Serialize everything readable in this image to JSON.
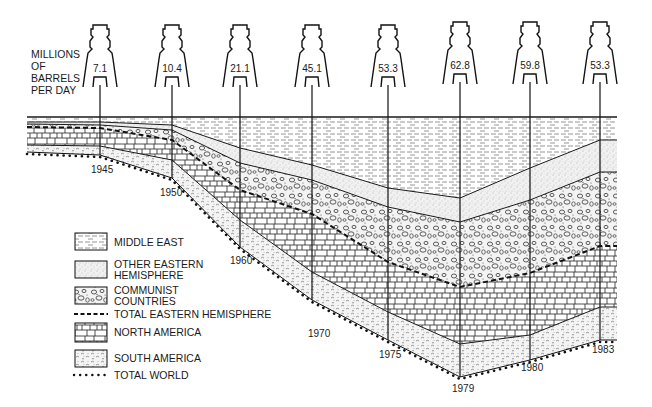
{
  "chart": {
    "unit_label_lines": [
      "MILLIONS",
      "OF",
      "BARRELS",
      "PER DAY"
    ]
  },
  "legend": {
    "items": [
      {
        "key": "middle_east",
        "lines": [
          "MIDDLE EAST"
        ],
        "style": "dashes"
      },
      {
        "key": "other_eastern_hemisphere",
        "lines": [
          "OTHER EASTERN",
          "HEMISPHERE"
        ],
        "style": "stipple"
      },
      {
        "key": "communist_countries",
        "lines": [
          "COMMUNIST",
          "COUNTRIES"
        ],
        "style": "pebbles"
      },
      {
        "key": "total_eastern_hemisphere",
        "lines": [
          "TOTAL EASTERN HEMISPHERE"
        ],
        "style": "dashed-line"
      },
      {
        "key": "north_america",
        "lines": [
          "NORTH AMERICA"
        ],
        "style": "bricks"
      },
      {
        "key": "south_america",
        "lines": [
          "SOUTH AMERICA"
        ],
        "style": "wavy"
      },
      {
        "key": "total_world",
        "lines": [
          "TOTAL WORLD"
        ],
        "style": "dotted-line"
      }
    ]
  },
  "towers": [
    {
      "year": "1945",
      "value": "7.1"
    },
    {
      "year": "1950",
      "value": "10.4"
    },
    {
      "year": "1960",
      "value": "21.1"
    },
    {
      "year": "1970",
      "value": "45.1"
    },
    {
      "year": "1975",
      "value": "53.3"
    },
    {
      "year": "1979",
      "value": "62.8"
    },
    {
      "year": "1980",
      "value": "59.8"
    },
    {
      "year": "1983",
      "value": "53.3"
    }
  ],
  "chart_data": {
    "type": "area",
    "ylabel": "MILLIONS OF BARRELS PER DAY",
    "xlabel": "",
    "orientation": "inverted stacked area (layers hang downward from a top baseline)",
    "categories": [
      "1945",
      "1950",
      "1960",
      "1970",
      "1975",
      "1979",
      "1980",
      "1983"
    ],
    "totals": [
      7.1,
      10.4,
      21.1,
      45.1,
      53.3,
      62.8,
      59.8,
      53.3
    ],
    "series": [
      {
        "name": "MIDDLE EAST",
        "values": [
          0.5,
          1.8,
          5.3,
          13.9,
          19.6,
          21.1,
          18.7,
          12.1
        ]
      },
      {
        "name": "OTHER EASTERN HEMISPHERE",
        "values": [
          0.2,
          0.5,
          1.5,
          4.5,
          5.1,
          6.0,
          6.0,
          6.7
        ]
      },
      {
        "name": "COMMUNIST COUNTRIES",
        "values": [
          0.6,
          1.1,
          4.1,
          7.6,
          12.5,
          14.1,
          14.2,
          14.6
        ]
      },
      {
        "name": "NORTH AMERICA",
        "values": [
          5.0,
          5.9,
          7.9,
          13.7,
          12.1,
          13.0,
          13.6,
          13.6
        ]
      },
      {
        "name": "SOUTH AMERICA",
        "values": [
          0.8,
          1.1,
          2.3,
          5.4,
          4.0,
          4.6,
          4.3,
          5.3
        ]
      }
    ],
    "lines": [
      {
        "name": "TOTAL EASTERN HEMISPHERE",
        "style": "dashed",
        "values": [
          1.3,
          3.4,
          10.9,
          26.0,
          37.2,
          41.2,
          38.9,
          33.4
        ]
      },
      {
        "name": "TOTAL WORLD",
        "style": "dotted",
        "values": [
          7.1,
          10.4,
          21.1,
          45.1,
          53.3,
          62.8,
          59.8,
          53.3
        ]
      }
    ],
    "legend_position": "lower-left",
    "grid": false
  }
}
